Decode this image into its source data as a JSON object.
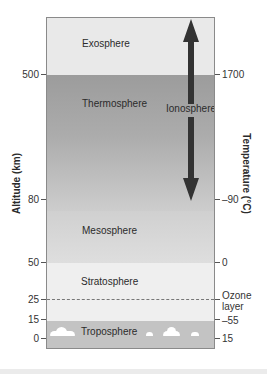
{
  "diagram": {
    "left_axis": {
      "title": "Altitude (km)",
      "ticks": [
        {
          "label": "500",
          "y": 74
        },
        {
          "label": "80",
          "y": 199
        },
        {
          "label": "50",
          "y": 262
        },
        {
          "label": "25",
          "y": 299
        },
        {
          "label": "15",
          "y": 319
        },
        {
          "label": "0",
          "y": 338
        }
      ]
    },
    "right_axis": {
      "title": "Temperature (°C)",
      "ticks": [
        {
          "label": "1700",
          "y": 74
        },
        {
          "label": "–90",
          "y": 199
        },
        {
          "label": "0",
          "y": 262
        },
        {
          "label": "Ozone layer",
          "y": 299
        },
        {
          "label": "–55",
          "y": 319
        },
        {
          "label": "15",
          "y": 338
        }
      ]
    },
    "layers": [
      {
        "name": "Exosphere",
        "color": "#e9e9e9"
      },
      {
        "name": "Thermosphere",
        "color": "#9d9d9d"
      },
      {
        "name": "Mesosphere",
        "color": "#d6d6d6"
      },
      {
        "name": "Stratosphere",
        "color": "#efefef"
      },
      {
        "name": "Troposphere",
        "color": "#c3c3c3"
      }
    ],
    "ionosphere": {
      "label": "Ionosphere",
      "arrow_color": "#333333"
    },
    "ozone_label": "Ozone layer"
  }
}
